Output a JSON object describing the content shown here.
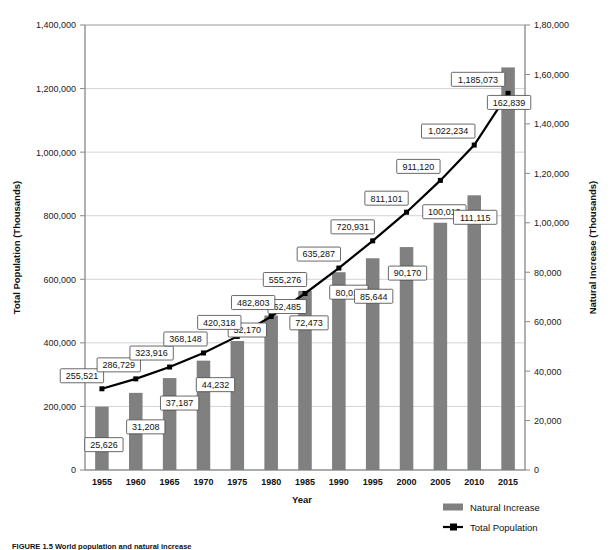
{
  "figure": {
    "caption": "FIGURE 1.5  World population and natural increase"
  },
  "chart_data": {
    "type": "bar",
    "title": "",
    "subtitle": "",
    "xlabel": "Year",
    "ylabel": "Total Population (Thousands)",
    "y2label": "Natural Increase (Thousands)",
    "categories": [
      "1955",
      "1960",
      "1965",
      "1970",
      "1975",
      "1980",
      "1985",
      "1990",
      "1995",
      "2000",
      "2005",
      "2010",
      "2015"
    ],
    "ylim": [
      0,
      1400000
    ],
    "y2lim": [
      0,
      180000
    ],
    "yticks": [
      "0",
      "200,000",
      "400,000",
      "600,000",
      "800,000",
      "1,000,000",
      "1,200,000",
      "1,400,000"
    ],
    "ytick_values": [
      0,
      200000,
      400000,
      600000,
      800000,
      1000000,
      1200000,
      1400000
    ],
    "y2ticks": [
      "0",
      "20,000",
      "40,000",
      "60,000",
      "80,000",
      "1,00,000",
      "1,20,000",
      "1,40,000",
      "1,60,000",
      "1,80,000"
    ],
    "y2tick_values": [
      0,
      20000,
      40000,
      60000,
      80000,
      100000,
      120000,
      140000,
      160000,
      180000
    ],
    "grid": true,
    "legend_position": "bottom-right",
    "series": [
      {
        "name": "Natural Increase",
        "chart_type": "bar",
        "axis": "right",
        "color": "#808080",
        "values": [
          25626,
          31208,
          37187,
          44232,
          52170,
          62485,
          72473,
          80011,
          85644,
          90170,
          100019,
          111115,
          162839
        ],
        "labels": [
          "25,626",
          "31,208",
          "37,187",
          "44,232",
          "52,170",
          "62,485",
          "72,473",
          "80,011",
          "85,644",
          "90,170",
          "100,019",
          "111,115",
          "162,839"
        ]
      },
      {
        "name": "Total Population",
        "chart_type": "line",
        "axis": "left",
        "color": "#000000",
        "values": [
          255521,
          286729,
          323916,
          368148,
          420318,
          482803,
          555276,
          635287,
          720931,
          811101,
          911120,
          1022234,
          1185073
        ],
        "labels": [
          "255,521",
          "286,729",
          "323,916",
          "368,148",
          "420,318",
          "482,803",
          "555,276",
          "635,287",
          "720,931",
          "811,101",
          "911,120",
          "1,022,234",
          "1,185,073"
        ]
      }
    ]
  }
}
